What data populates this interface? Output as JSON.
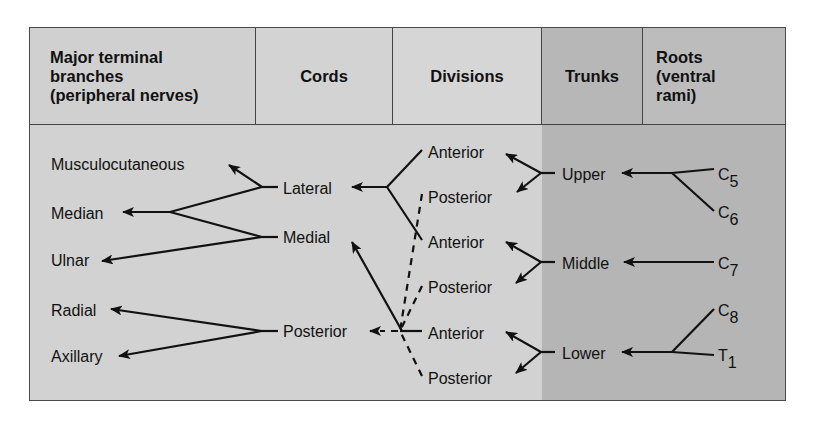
{
  "headers": {
    "terminal": [
      "Major terminal",
      "branches",
      "(peripheral nerves)"
    ],
    "cords": "Cords",
    "divisions": "Divisions",
    "trunks": "Trunks",
    "roots": [
      "Roots",
      "(ventral",
      "rami)"
    ]
  },
  "terminal_branches": [
    "Musculocutaneous",
    "Median",
    "Ulnar",
    "Radial",
    "Axillary"
  ],
  "cords": [
    "Lateral",
    "Medial",
    "Posterior"
  ],
  "divisions": [
    "Anterior",
    "Posterior",
    "Anterior",
    "Posterior",
    "Anterior",
    "Posterior"
  ],
  "trunks": [
    "Upper",
    "Middle",
    "Lower"
  ],
  "roots": [
    {
      "base": "C",
      "sub": "5"
    },
    {
      "base": "C",
      "sub": "6"
    },
    {
      "base": "C",
      "sub": "7"
    },
    {
      "base": "C",
      "sub": "8"
    },
    {
      "base": "T",
      "sub": "1"
    }
  ],
  "connections": [
    {
      "from": "C5",
      "to": "Upper"
    },
    {
      "from": "C6",
      "to": "Upper"
    },
    {
      "from": "C7",
      "to": "Middle"
    },
    {
      "from": "C8",
      "to": "Lower"
    },
    {
      "from": "T1",
      "to": "Lower"
    },
    {
      "from": "Upper",
      "to": "Anterior (upper)"
    },
    {
      "from": "Upper",
      "to": "Posterior (upper)"
    },
    {
      "from": "Middle",
      "to": "Anterior (middle)"
    },
    {
      "from": "Middle",
      "to": "Posterior (middle)"
    },
    {
      "from": "Lower",
      "to": "Anterior (lower)"
    },
    {
      "from": "Lower",
      "to": "Posterior (lower)"
    },
    {
      "from": "Anterior (upper)",
      "to": "Lateral"
    },
    {
      "from": "Anterior (middle)",
      "to": "Lateral"
    },
    {
      "from": "Anterior (lower)",
      "to": "Medial"
    },
    {
      "from": "Posterior (upper)",
      "to": "Posterior cord",
      "style": "dashed"
    },
    {
      "from": "Posterior (middle)",
      "to": "Posterior cord",
      "style": "dashed"
    },
    {
      "from": "Posterior (lower)",
      "to": "Posterior cord",
      "style": "dashed"
    },
    {
      "from": "Lateral",
      "to": "Musculocutaneous"
    },
    {
      "from": "Lateral",
      "to": "Median"
    },
    {
      "from": "Medial",
      "to": "Median"
    },
    {
      "from": "Medial",
      "to": "Ulnar"
    },
    {
      "from": "Posterior cord",
      "to": "Radial"
    },
    {
      "from": "Posterior cord",
      "to": "Axillary"
    }
  ]
}
